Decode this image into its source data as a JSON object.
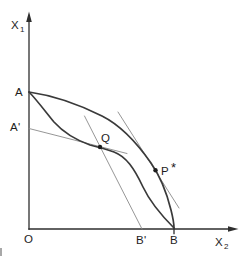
{
  "figure": {
    "colors": {
      "background": "#ffffff",
      "ink": "#2e2e2e",
      "curve_ink": "#3a3a3a",
      "thin_line_ink": "#8a8a8a",
      "dot_ink": "#1c1c1c"
    },
    "labels": {
      "y_axis": {
        "base": "X",
        "sub": "1"
      },
      "x_axis": {
        "base": "X",
        "sub": "2"
      },
      "origin": "O",
      "a": "A",
      "a_prime": "A'",
      "q": "Q",
      "p_star": {
        "base": "P",
        "sup": "*"
      },
      "b_prime": "B'",
      "b": "B"
    },
    "geometry": {
      "y_axis": "M29,229 L29,17",
      "y_arrow": "M29,11.5 L26.2,22 L31.8,22 Z",
      "x_axis": "M29,229 L232,229",
      "x_arrow": "M238.5,229 L228,226.2 L228,231.8 Z",
      "outer_curve": "M29,92 C50,95 78,104 102,116 C120,125 137,143 151,163 C158,173 166,190 171,210 C173,218 174,224 174,228",
      "inner_curve": "M29,92 C36,99 45,111 54,122 C63,132 76,140 90,145 C98,147 106,149 114,152 C126,156.5 134,168 143,187 C151,204 164,218 174,228",
      "price_line_a_prime_q": "M29,128.5 L127,153.5",
      "steep_line_q_b_prime": "M84.5,116 L142,229",
      "tangent_line_p_star": "M118,112 L179,208",
      "b_tick": "M174,229 L174,233.5",
      "q_dot": {
        "cx": 100,
        "cy": 147,
        "r": 2.2
      },
      "p_dot": {
        "cx": 155.5,
        "cy": 170.3,
        "r": 2.2
      }
    }
  }
}
